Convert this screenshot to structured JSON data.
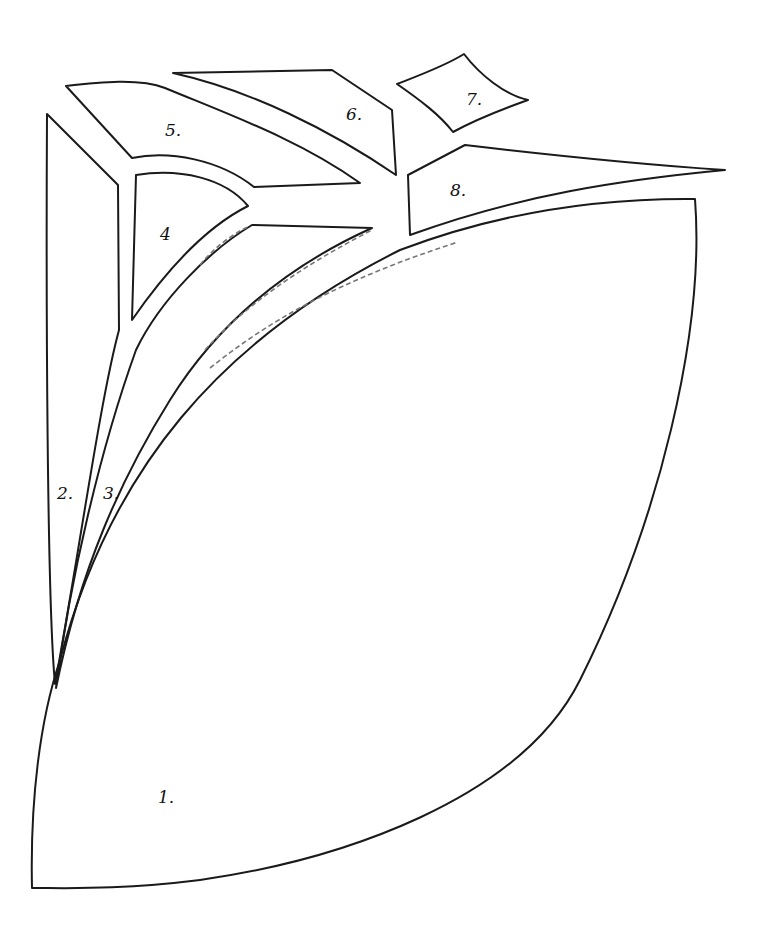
{
  "diagram": {
    "type": "pattern-pieces",
    "stroke_color": "#1a1a1a",
    "background": "#ffffff",
    "pieces": [
      {
        "id": 1,
        "label": "1.",
        "label_x": 158,
        "label_y": 787
      },
      {
        "id": 2,
        "label": "2.",
        "label_x": 57,
        "label_y": 483
      },
      {
        "id": 3,
        "label": "3.",
        "label_x": 103,
        "label_y": 483
      },
      {
        "id": 4,
        "label": "4",
        "label_x": 160,
        "label_y": 224
      },
      {
        "id": 5,
        "label": "5.",
        "label_x": 165,
        "label_y": 120
      },
      {
        "id": 6,
        "label": "6.",
        "label_x": 346,
        "label_y": 104
      },
      {
        "id": 7,
        "label": "7.",
        "label_x": 466,
        "label_y": 89
      },
      {
        "id": 8,
        "label": "8.",
        "label_x": 450,
        "label_y": 180
      }
    ]
  }
}
